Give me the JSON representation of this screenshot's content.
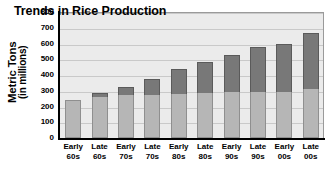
{
  "chart_data": {
    "type": "bar",
    "stacked": true,
    "title": "Trends in Rice Production",
    "xlabel": "",
    "ylabel": "Metric Tons",
    "ylabel_sub": "(in millions)",
    "ylim": [
      0,
      800
    ],
    "yticks": [
      0,
      100,
      200,
      300,
      400,
      500,
      600,
      700,
      800
    ],
    "ytick_labels": [
      "0",
      "100",
      "200",
      "300",
      "400",
      "500",
      "600",
      "700",
      "800"
    ],
    "grid": true,
    "legend": "none",
    "categories": [
      "Early 60s",
      "Late 60s",
      "Early 70s",
      "Late 70s",
      "Early 80s",
      "Late 80s",
      "Early 90s",
      "Late 90s",
      "Early 00s",
      "Late 00s"
    ],
    "category_lines": [
      [
        "Early",
        "60s"
      ],
      [
        "Late",
        "60s"
      ],
      [
        "Early",
        "70s"
      ],
      [
        "Late",
        "70s"
      ],
      [
        "Early",
        "80s"
      ],
      [
        "Late",
        "80s"
      ],
      [
        "Early",
        "90s"
      ],
      [
        "Late",
        "90s"
      ],
      [
        "Early",
        "00s"
      ],
      [
        "Late",
        "00s"
      ]
    ],
    "series": [
      {
        "name": "lower-segment",
        "color": "#b6b6b6",
        "values": [
          240,
          260,
          275,
          275,
          280,
          285,
          290,
          295,
          290,
          310
        ]
      },
      {
        "name": "upper-segment",
        "color": "#787878",
        "values": [
          0,
          25,
          50,
          100,
          160,
          200,
          235,
          285,
          310,
          360
        ]
      }
    ],
    "totals": [
      240,
      285,
      325,
      375,
      440,
      485,
      525,
      580,
      600,
      670
    ]
  },
  "colors": {
    "plot_background": "#ebebeb",
    "gridline": "#c9c9c9",
    "axis": "#000000",
    "bar_lower": "#b6b6b6",
    "bar_upper": "#787878",
    "page_background": "#ffffff"
  }
}
